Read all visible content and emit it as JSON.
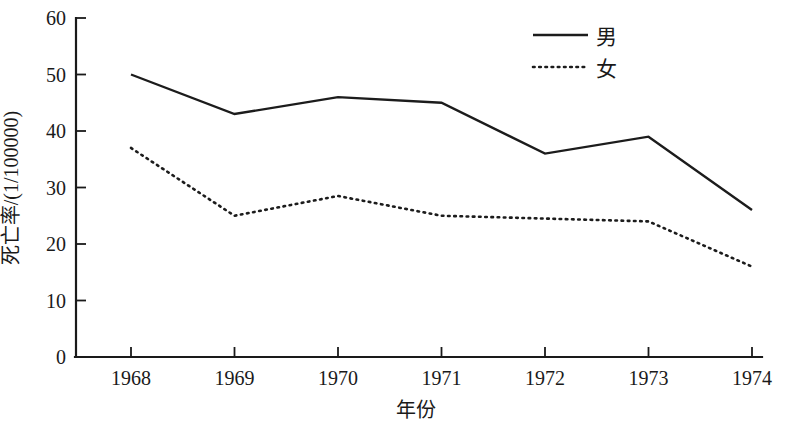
{
  "chart_data": {
    "type": "line",
    "title": "",
    "xlabel": "年份",
    "ylabel": "死亡率/(1/100000)",
    "x": [
      1968,
      1969,
      1970,
      1971,
      1972,
      1973,
      1974
    ],
    "xtick_labels": [
      "1968",
      "1969",
      "1970",
      "1971",
      "1972",
      "1973",
      "1974"
    ],
    "ytick_labels": [
      "0",
      "10",
      "20",
      "30",
      "40",
      "50",
      "60"
    ],
    "yticks": [
      0,
      10,
      20,
      30,
      40,
      50,
      60
    ],
    "xlim": [
      1967.45,
      1974.1
    ],
    "ylim": [
      0,
      60
    ],
    "grid": false,
    "legend_position": "top-right",
    "series": [
      {
        "name": "男",
        "style": "solid",
        "color": "#1c1c1c",
        "values": [
          50,
          43,
          46,
          45,
          36,
          39,
          26
        ]
      },
      {
        "name": "女",
        "style": "dotted",
        "color": "#1c1c1c",
        "values": [
          37,
          25,
          28.5,
          25,
          24.5,
          24,
          16
        ]
      }
    ]
  },
  "axes": {
    "y_axis_label": "死亡率/(1/100000)",
    "x_axis_label": "年份"
  },
  "legend": {
    "items": [
      {
        "label": "男",
        "style": "solid"
      },
      {
        "label": "女",
        "style": "dotted"
      }
    ]
  }
}
